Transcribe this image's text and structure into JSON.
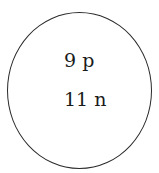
{
  "diagram": {
    "type": "atomic-nucleus",
    "nucleus": {
      "protons_label": "9 p",
      "neutrons_label": "11 n",
      "protons": 9,
      "neutrons": 11
    },
    "colors": {
      "outline": "#2a2a2a",
      "text": "#1a1a1a",
      "background": "#ffffff"
    }
  }
}
